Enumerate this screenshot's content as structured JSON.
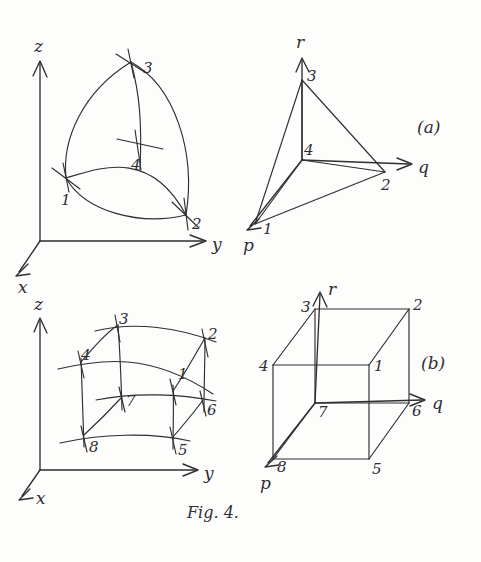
{
  "figure": {
    "caption": "Fig. 4.",
    "panels": [
      {
        "id": "panel-a",
        "label": "(a)",
        "subfigures": [
          {
            "id": "curved-tetrahedron",
            "kind": "curvilinear-tetrahedron",
            "description": "curved-sided tetrahedron element in physical x-y-z space",
            "axes": [
              {
                "name": "z",
                "label": "z",
                "direction": "up"
              },
              {
                "name": "y",
                "label": "y",
                "direction": "right"
              },
              {
                "name": "x",
                "label": "x",
                "direction": "down-left"
              }
            ],
            "nodes": [
              {
                "label": "1",
                "x": 66,
                "y": 178
              },
              {
                "label": "2",
                "x": 186,
                "y": 215
              },
              {
                "label": "3",
                "x": 131,
                "y": 62
              },
              {
                "label": "4",
                "x": 139,
                "y": 150
              }
            ]
          },
          {
            "id": "straight-tetrahedron",
            "kind": "reference-tetrahedron",
            "description": "straight-sided reference tetrahedron in p-q-r space",
            "axes": [
              {
                "name": "r",
                "label": "r",
                "direction": "up"
              },
              {
                "name": "q",
                "label": "q",
                "direction": "right"
              },
              {
                "name": "p",
                "label": "p",
                "direction": "down-left"
              }
            ],
            "nodes": [
              {
                "label": "1",
                "x": 260,
                "y": 223
              },
              {
                "label": "2",
                "x": 385,
                "y": 172
              },
              {
                "label": "3",
                "x": 302,
                "y": 80
              },
              {
                "label": "4",
                "x": 302,
                "y": 160
              }
            ]
          }
        ]
      },
      {
        "id": "panel-b",
        "label": "(b)",
        "subfigures": [
          {
            "id": "curved-hexahedron",
            "kind": "curvilinear-hexahedron",
            "description": "curved-sided eight-node brick element in physical x-y-z space",
            "axes": [
              {
                "name": "z",
                "label": "z",
                "direction": "up"
              },
              {
                "name": "y",
                "label": "y",
                "direction": "right"
              },
              {
                "name": "x",
                "label": "x",
                "direction": "down-left"
              }
            ],
            "nodes": [
              {
                "label": "1",
                "x": 173,
                "y": 391
              },
              {
                "label": "2",
                "x": 205,
                "y": 338
              },
              {
                "label": "3",
                "x": 118,
                "y": 325
              },
              {
                "label": "4",
                "x": 81,
                "y": 362
              },
              {
                "label": "5",
                "x": 173,
                "y": 437
              },
              {
                "label": "6",
                "x": 203,
                "y": 400
              },
              {
                "label": "7",
                "x": 122,
                "y": 397
              },
              {
                "label": "8",
                "x": 84,
                "y": 435
              }
            ]
          },
          {
            "id": "cube",
            "kind": "reference-cube",
            "description": "straight-sided reference cube in p-q-r space",
            "axes": [
              {
                "name": "r",
                "label": "r",
                "direction": "up"
              },
              {
                "name": "q",
                "label": "q",
                "direction": "right"
              },
              {
                "name": "p",
                "label": "p",
                "direction": "down-left"
              }
            ],
            "nodes": [
              {
                "label": "1",
                "x": 369,
                "y": 365
              },
              {
                "label": "2",
                "x": 409,
                "y": 309
              },
              {
                "label": "3",
                "x": 315,
                "y": 309
              },
              {
                "label": "4",
                "x": 273,
                "y": 365
              },
              {
                "label": "5",
                "x": 369,
                "y": 459
              },
              {
                "label": "6",
                "x": 409,
                "y": 403
              },
              {
                "label": "7",
                "x": 315,
                "y": 403
              },
              {
                "label": "8",
                "x": 273,
                "y": 459
              }
            ]
          }
        ]
      }
    ]
  },
  "colors": {
    "ink": "#2e2e33",
    "paper": "#fdfdfb"
  }
}
